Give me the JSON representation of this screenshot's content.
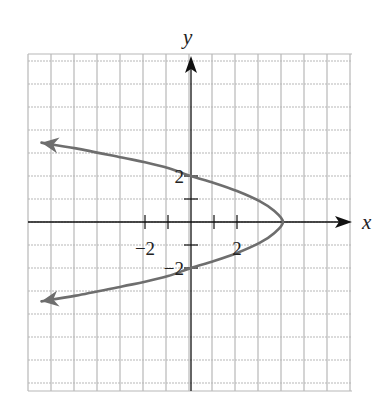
{
  "chart_data": {
    "type": "line",
    "title": "",
    "xlabel": "x",
    "ylabel": "y",
    "xlim": [
      -7,
      7
    ],
    "ylim": [
      -7,
      7
    ],
    "grid": true,
    "legend": null,
    "x_tick_labels": [
      {
        "value": -2,
        "label": "−2"
      },
      {
        "value": 2,
        "label": "2"
      }
    ],
    "y_tick_labels": [
      {
        "value": 2,
        "label": "2"
      },
      {
        "value": -2,
        "label": "−2"
      }
    ],
    "x_ticks": [
      -2,
      -1,
      1,
      2
    ],
    "y_ticks": [
      -2,
      -1,
      1,
      2
    ],
    "series": [
      {
        "name": "parabola opening left",
        "color": "#6e6e6e",
        "arrows_both_ends": true,
        "vertex": [
          4,
          0
        ],
        "intercepts": {
          "y": [
            2,
            -2
          ],
          "x": [
            4
          ]
        },
        "points": [
          [
            -6.5,
            3.45
          ],
          [
            -5,
            3.2
          ],
          [
            -3,
            2.8
          ],
          [
            -2,
            2.6
          ],
          [
            -1,
            2.35
          ],
          [
            0,
            2
          ],
          [
            1,
            1.7
          ],
          [
            2,
            1.35
          ],
          [
            3,
            0.9
          ],
          [
            3.6,
            0.5
          ],
          [
            4,
            0
          ],
          [
            3.6,
            -0.5
          ],
          [
            3,
            -0.9
          ],
          [
            2,
            -1.35
          ],
          [
            1,
            -1.7
          ],
          [
            0,
            -2
          ],
          [
            -1,
            -2.35
          ],
          [
            -2,
            -2.6
          ],
          [
            -3,
            -2.8
          ],
          [
            -5,
            -3.2
          ],
          [
            -6.5,
            -3.45
          ]
        ]
      }
    ]
  },
  "layout": {
    "origin_px": [
      191,
      222
    ],
    "unit_px": 23,
    "grid_left": 28,
    "grid_top": 54,
    "grid_right": 352,
    "grid_bottom": 391,
    "grid_color": "#b8b8b8",
    "axis_color": "#111111"
  }
}
